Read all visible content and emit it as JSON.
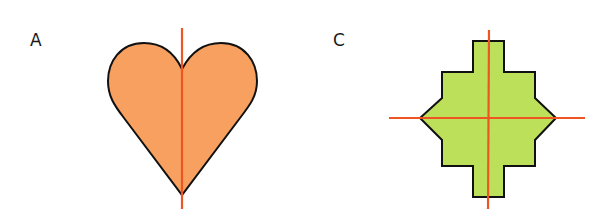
{
  "figures": [
    {
      "label": "A",
      "shape": "heart",
      "fill_color": "#f7a05f",
      "outline_color": "#111111",
      "symmetry_lines": [
        "vertical"
      ],
      "line_color": "#ee5522"
    },
    {
      "label": "C",
      "shape": "stepped-octagon",
      "fill_color": "#bde05a",
      "outline_color": "#111111",
      "symmetry_lines": [
        "vertical",
        "horizontal"
      ],
      "line_color": "#ee5522"
    }
  ]
}
